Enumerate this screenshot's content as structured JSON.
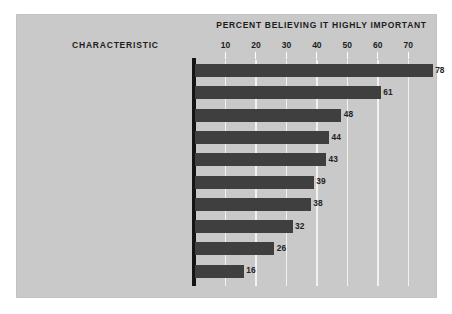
{
  "chart_data": {
    "type": "bar",
    "orientation": "horizontal",
    "title": "PERCENT BELIEVING IT HIGHLY IMPORTANT",
    "xlabel": "",
    "ylabel": "CHARACTERISTIC",
    "categories": [
      "Opportunity to use special abilities",
      "Can look forward to stable, secure future",
      "Can be creative and original",
      "Can work with people rather than things",
      "Can be helpful to others",
      "Chance to earn a great deal of money",
      "Can be relatively free of supervision",
      "Can exercise leadership",
      "Has status and prestige",
      "Can lead to adventure"
    ],
    "values": [
      78,
      61,
      48,
      44,
      43,
      39,
      38,
      32,
      26,
      16
    ],
    "value_labels": [
      "78",
      "61",
      "48",
      "44",
      "43",
      "39",
      "38",
      "32",
      "26",
      "16"
    ],
    "xlim": [
      0,
      79
    ],
    "xticks": [
      10,
      20,
      30,
      40,
      50,
      60,
      70
    ],
    "xticklabels": [
      "10",
      "20",
      "30",
      "40",
      "50",
      "60",
      "70"
    ],
    "grid": "vertical-white",
    "legend": null,
    "bar_color": "#3f3f3f",
    "panel_color": "#c9c9c9",
    "gridline_color": "#f2f2f2",
    "axis_color": "#141414",
    "text_color": "#232323"
  }
}
